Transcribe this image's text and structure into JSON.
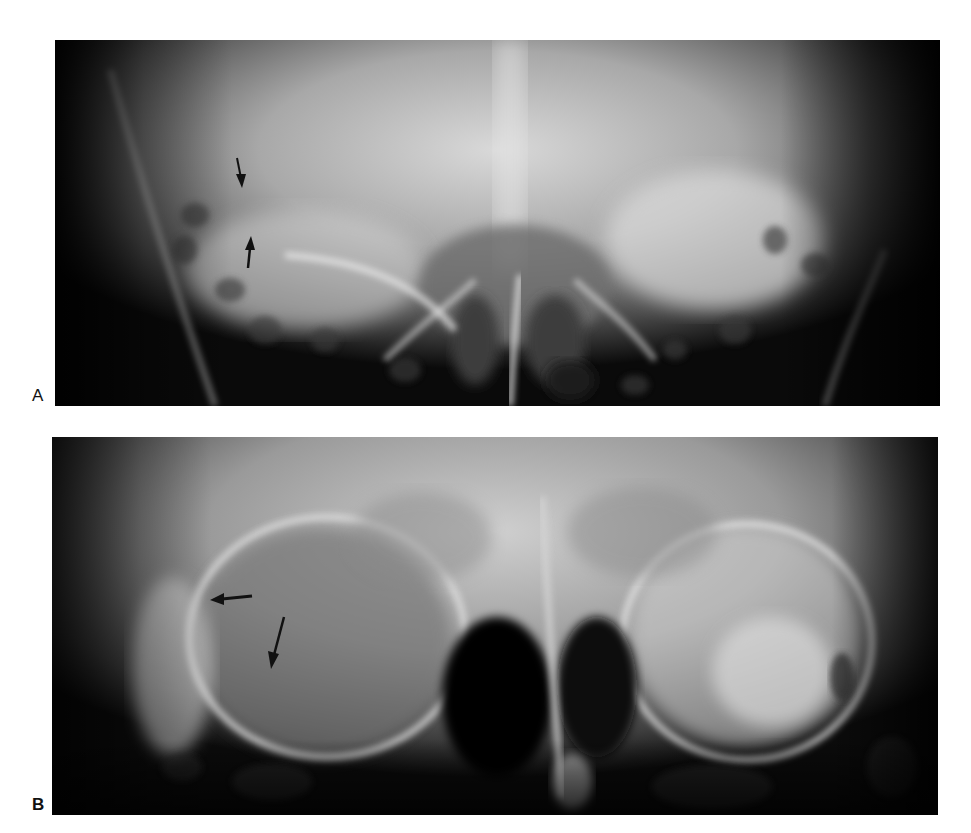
{
  "figure": {
    "panels": [
      {
        "label": "A",
        "description": "Frontal skull radiograph (Caldwell-type view) showing orbits and nasal cavity; two black arrows at upper left orbital region pointing toward each other (one pointing down, one pointing up).",
        "arrows": [
          {
            "direction": "down",
            "x": 240,
            "y": 175
          },
          {
            "direction": "up",
            "x": 248,
            "y": 255
          }
        ]
      },
      {
        "label": "B",
        "description": "Frontal skull radiograph showing orbits with ring-like lucent areas; two black arrows at the left orbit (one pointing left, one pointing down-left).",
        "arrows": [
          {
            "direction": "left",
            "x": 230,
            "y": 598
          },
          {
            "direction": "down",
            "x": 273,
            "y": 640
          }
        ]
      }
    ]
  },
  "colors": {
    "background": "#ffffff",
    "film_dark": "#000000",
    "bone_bright": "#e8e8e8",
    "arrow": "#111111"
  }
}
